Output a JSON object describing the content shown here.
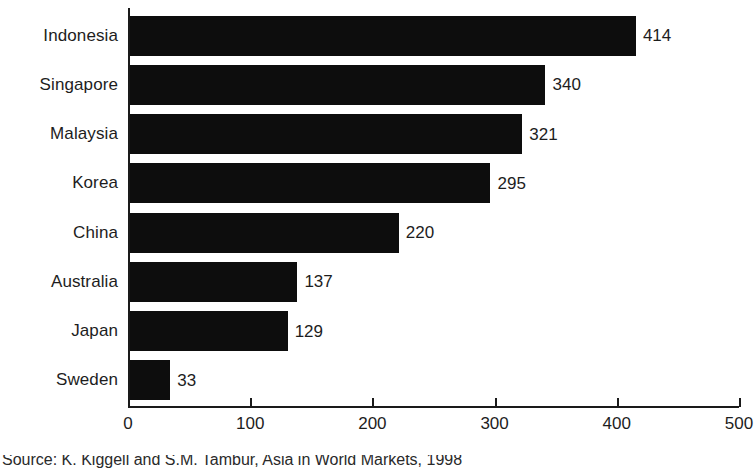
{
  "chart_data": {
    "type": "bar",
    "orientation": "horizontal",
    "title": "",
    "xlabel": "",
    "ylabel": "",
    "categories": [
      "Indonesia",
      "Singapore",
      "Malaysia",
      "Korea",
      "China",
      "Australia",
      "Japan",
      "Sweden"
    ],
    "values": [
      414,
      340,
      321,
      295,
      220,
      137,
      129,
      33
    ],
    "value_labels": [
      "414",
      "340",
      "321",
      "295",
      "220",
      "137",
      "129",
      "33"
    ],
    "xlim": [
      0,
      500
    ],
    "xticks": [
      0,
      100,
      200,
      300,
      400,
      500
    ],
    "xtick_labels": [
      "0",
      "100",
      "200",
      "300",
      "400",
      "500"
    ],
    "grid": false,
    "legend": null,
    "bar_color": "#0d0d0d",
    "background_color": "#ffffff",
    "text_color": "#1d1d1d",
    "axis_color": "#1a1a1a"
  },
  "caption": {
    "source_text": "Source: K. Kiggell and S.M. Tambur, Asia in World Markets, 1998"
  }
}
